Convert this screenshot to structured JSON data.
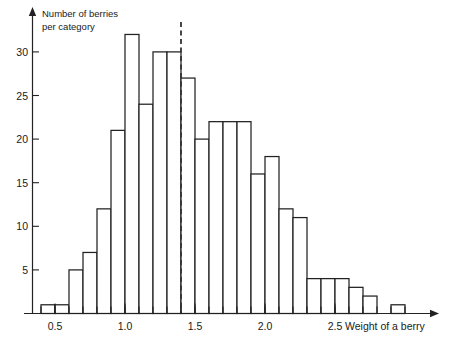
{
  "chart_data": {
    "type": "bar",
    "title": "",
    "subtitle": "",
    "ylabel_line1": "Number of berries",
    "ylabel_line2": "per category",
    "xlabel": "Weight of a berry",
    "bin_width": 0.1,
    "x_start": 0.4,
    "x_end": 3.0,
    "categories": [
      "0.4-0.5",
      "0.5-0.6",
      "0.6-0.7",
      "0.7-0.8",
      "0.8-0.9",
      "0.9-1.0",
      "1.0-1.1",
      "1.1-1.2",
      "1.2-1.3",
      "1.3-1.4",
      "1.4-1.5",
      "1.5-1.6",
      "1.6-1.7",
      "1.7-1.8",
      "1.8-1.9",
      "1.9-2.0",
      "2.0-2.1",
      "2.1-2.2",
      "2.2-2.3",
      "2.3-2.4",
      "2.4-2.5",
      "2.5-2.6",
      "2.6-2.7",
      "2.7-2.8",
      "2.8-2.9"
    ],
    "bin_left_edges": [
      0.4,
      0.5,
      0.6,
      0.7,
      0.8,
      0.9,
      1.0,
      1.1,
      1.2,
      1.3,
      1.4,
      1.5,
      1.6,
      1.7,
      1.8,
      1.9,
      2.0,
      2.1,
      2.2,
      2.3,
      2.4,
      2.5,
      2.6,
      2.7,
      2.8
    ],
    "values": [
      1,
      1,
      5,
      7,
      12,
      21,
      32,
      24,
      30,
      30,
      27,
      20,
      22,
      22,
      22,
      16,
      18,
      12,
      11,
      4,
      4,
      4,
      3,
      2,
      0
    ],
    "extra_bars": [
      {
        "left_edge": 2.9,
        "value": 1
      }
    ],
    "xlim": [
      0.3,
      3.05
    ],
    "ylim": [
      0,
      34
    ],
    "x_ticks": [
      0.5,
      1.0,
      1.5,
      2.0,
      2.5
    ],
    "x_tick_labels": [
      "0.5",
      "1.0",
      "1.5",
      "2.0",
      "2.5"
    ],
    "x_minor_ticks": [
      0.4,
      0.5,
      0.6,
      0.7,
      0.8,
      0.9,
      1.0,
      1.1,
      1.2,
      1.3,
      1.4,
      1.5,
      1.6,
      1.7,
      1.8,
      1.9,
      2.0,
      2.1,
      2.2,
      2.3,
      2.4,
      2.5,
      2.6,
      2.7,
      2.8,
      2.9,
      3.0
    ],
    "y_ticks": [
      5,
      10,
      15,
      20,
      25,
      30
    ],
    "y_tick_labels": [
      "5",
      "10",
      "15",
      "20",
      "25",
      "30"
    ],
    "grid": false,
    "legend": "none",
    "annotations": [
      {
        "name": "threshold-line",
        "type": "vertical-dashed-line",
        "x": 1.4,
        "label": ""
      }
    ],
    "colors": {
      "bar_fill": "#ffffff",
      "bar_stroke": "#222222",
      "axis": "#222222",
      "marker": "#333333",
      "background": "#ffffff"
    }
  }
}
